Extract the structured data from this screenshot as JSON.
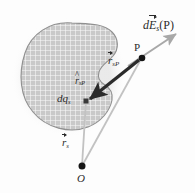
{
  "figure": {
    "background_color": "#fdfdfd",
    "body": {
      "name": "charged-body-blob",
      "fill_color": "#c9c9c9",
      "grid_color": "#ffffff",
      "outline_color": "#8c8c8c",
      "grid_spacing_px": 5
    },
    "colors": {
      "dark_vector": "#2b2b2b",
      "light_vector": "#b9b9b9",
      "field_arrow": "#a8a8a8",
      "point_marker": "#111111",
      "label_text": "#2b2b2b"
    },
    "points": [
      {
        "id": "P",
        "label": "P",
        "x": 142,
        "y": 58,
        "marker": "dot",
        "radius": 3.2
      },
      {
        "id": "O",
        "label": "O",
        "x": 82,
        "y": 166,
        "marker": "dot",
        "radius": 3.4
      },
      {
        "id": "dq_s",
        "label": "dq",
        "x": 86,
        "y": 101,
        "marker": "square",
        "size": 4.5
      }
    ],
    "labels": {
      "field_vector": {
        "name": "field-vector-label",
        "text_parts": {
          "d": "d",
          "E": "E",
          "subscript": "s",
          "argument": "(P)"
        },
        "plain": "dE_s(P)",
        "decoration": "vector-arrow-over-E"
      },
      "point_P": {
        "name": "point-P-label",
        "text": "P"
      },
      "separation_vector": {
        "name": "separation-vector-label",
        "text_parts": {
          "r": "r",
          "subscript": "sP"
        },
        "plain": "r_sP",
        "decoration": "vector-arrow-over-r"
      },
      "unit_vector": {
        "name": "unit-vector-label",
        "text_parts": {
          "r": "r",
          "subscript": "sP"
        },
        "plain": "r̂_sP",
        "decoration": "hat-over-r"
      },
      "charge_element": {
        "name": "charge-element-label",
        "text_parts": {
          "d": "d",
          "q": "q",
          "subscript": "s"
        },
        "plain": "dq_s",
        "decoration": "none"
      },
      "source_position_vector": {
        "name": "source-position-vector-label",
        "text_parts": {
          "r": "r",
          "subscript": "s"
        },
        "plain": "r_s",
        "decoration": "vector-arrow-over-r"
      },
      "origin": {
        "name": "origin-label",
        "text": "O"
      }
    },
    "vectors": [
      {
        "name": "separation-vector-arrow",
        "from": "dq_s",
        "to": "P",
        "style": "thick-dark-arrow",
        "color": "#2b2b2b",
        "width_px": 3.2
      },
      {
        "name": "field-direction-arrow",
        "from": "P",
        "to": "tip",
        "tip": {
          "x": 176,
          "y": 35
        },
        "style": "thin-gray-arrow",
        "color": "#a8a8a8",
        "width_px": 2.0
      },
      {
        "name": "source-position-vector-line",
        "from": "O",
        "to": "dq_s",
        "style": "thin-light-line",
        "color": "#b9b9b9",
        "width_px": 1.6
      },
      {
        "name": "field-point-position-line",
        "from": "O",
        "to": "P",
        "style": "thin-light-line",
        "color": "#b9b9b9",
        "width_px": 1.6
      }
    ]
  }
}
